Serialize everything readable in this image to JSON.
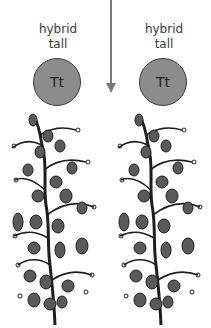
{
  "offspring": [
    {
      "label_line1": "hybrid",
      "label_line2": "tall",
      "genotype": "Tt"
    },
    {
      "label_line1": "hybrid",
      "label_line2": "tall",
      "genotype": "Tt"
    }
  ],
  "colors": {
    "circle_fill": "#8c8c8c",
    "circle_border": "#3c3c3c",
    "arrow": "#7a7a7a",
    "plant": "#1e1e1e",
    "leaf": "#5a5a5a"
  }
}
